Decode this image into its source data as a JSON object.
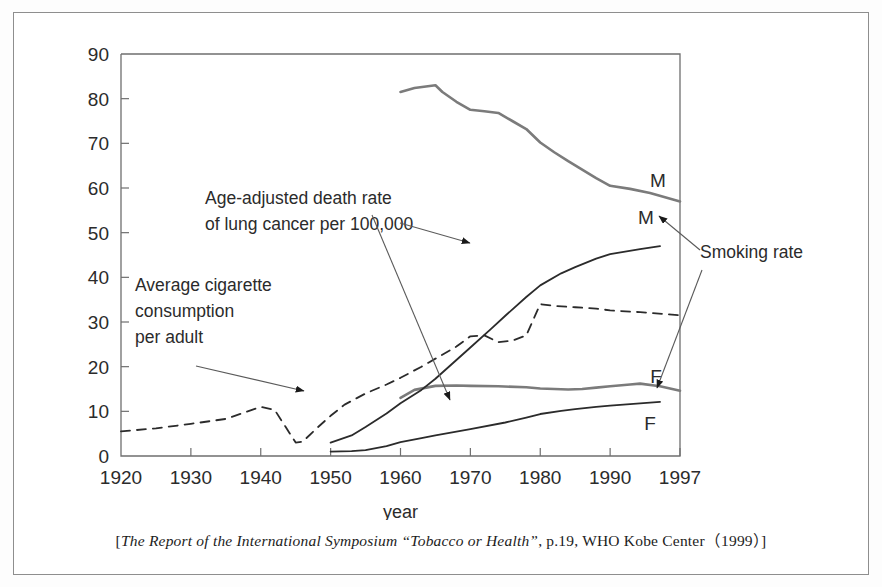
{
  "caption": {
    "open_bracket": "[",
    "italic_part": "The Report of the International Symposium “Tobacco or Health”",
    "rest": ", p.19, WHO Kobe Center（1999）",
    "close_bracket": "]"
  },
  "chart_data": {
    "type": "line",
    "title": "",
    "xlabel": "year",
    "ylabel": "",
    "xlim": [
      1920,
      1997
    ],
    "ylim": [
      0,
      90
    ],
    "grid": false,
    "legend": "inline-endpoint-labels",
    "xticks": [
      1920,
      1930,
      1940,
      1950,
      1960,
      1970,
      1980,
      1990,
      1997
    ],
    "xtick_labels": [
      "1920",
      "1930",
      "1940",
      "1950",
      "1960",
      "1970",
      "1980",
      "1990",
      "1997"
    ],
    "yticks": [
      0,
      10,
      20,
      30,
      40,
      50,
      60,
      70,
      80,
      90
    ],
    "ytick_labels": [
      "0",
      "10",
      "20",
      "30",
      "40",
      "50",
      "60",
      "70",
      "80",
      "90"
    ],
    "series": [
      {
        "name": "Smoking rate M",
        "style": "solid-gray",
        "color": "#7b7b7b",
        "width": 2.6,
        "endpoint_label": "M",
        "x": [
          1960,
          1962,
          1965,
          1966,
          1968,
          1970,
          1972,
          1974,
          1976,
          1978,
          1980,
          1982,
          1984,
          1986,
          1988,
          1990,
          1992,
          1994,
          1997
        ],
        "values": [
          81.5,
          82.4,
          83.0,
          81.5,
          79.3,
          77.5,
          77.2,
          76.8,
          75.0,
          73.2,
          70.2,
          68.0,
          66.0,
          64.1,
          62.2,
          60.5,
          59.8,
          58.9,
          57.0
        ]
      },
      {
        "name": "Smoking rate F",
        "style": "solid-gray",
        "color": "#7b7b7b",
        "width": 2.6,
        "endpoint_label": "F",
        "x": [
          1960,
          1962,
          1965,
          1968,
          1970,
          1974,
          1978,
          1980,
          1984,
          1986,
          1988,
          1990,
          1992,
          1993,
          1995,
          1997
        ],
        "values": [
          13.0,
          14.8,
          15.7,
          15.8,
          15.7,
          15.6,
          15.4,
          15.1,
          14.9,
          15.0,
          15.3,
          15.6,
          16.0,
          16.2,
          15.6,
          14.6
        ]
      },
      {
        "name": "Age-adjusted death rate of lung cancer M",
        "style": "solid-black",
        "color": "#2b2b2b",
        "width": 1.8,
        "endpoint_label": "M",
        "x": [
          1950,
          1953,
          1955,
          1958,
          1960,
          1963,
          1965,
          1968,
          1970,
          1973,
          1975,
          1978,
          1980,
          1983,
          1985,
          1988,
          1990,
          1993,
          1995
        ],
        "values": [
          3.0,
          4.6,
          6.5,
          9.5,
          11.8,
          14.8,
          17.3,
          21.5,
          24.3,
          28.5,
          31.4,
          35.6,
          38.2,
          40.9,
          42.3,
          44.2,
          45.2,
          46.3,
          47.0
        ]
      },
      {
        "name": "Age-adjusted death rate of lung cancer F",
        "style": "solid-black",
        "color": "#2b2b2b",
        "width": 1.8,
        "endpoint_label": "F",
        "x": [
          1950,
          1953,
          1955,
          1958,
          1960,
          1963,
          1965,
          1970,
          1975,
          1978,
          1980,
          1983,
          1985,
          1988,
          1990,
          1993,
          1995
        ],
        "values": [
          1.0,
          1.1,
          1.3,
          2.2,
          3.1,
          4.0,
          4.6,
          6.0,
          7.5,
          8.6,
          9.4,
          10.1,
          10.5,
          11.0,
          11.3,
          11.8,
          12.1
        ]
      },
      {
        "name": "Average cigarette consumption per adult",
        "style": "dashed",
        "color": "#2b2b2b",
        "width": 1.8,
        "endpoint_label": "",
        "x": [
          1920,
          1925,
          1930,
          1935,
          1940,
          1942,
          1945,
          1946,
          1948,
          1950,
          1952,
          1955,
          1958,
          1960,
          1963,
          1965,
          1968,
          1970,
          1972,
          1974,
          1976,
          1978,
          1980,
          1982,
          1985,
          1988,
          1990,
          1993,
          1997
        ],
        "values": [
          5.5,
          6.2,
          7.2,
          8.3,
          11.0,
          10.3,
          3.0,
          3.2,
          6.2,
          9.0,
          11.5,
          14.0,
          16.0,
          17.5,
          20.0,
          21.8,
          24.5,
          26.8,
          27.0,
          25.5,
          25.8,
          27.0,
          34.0,
          33.6,
          33.3,
          33.0,
          32.6,
          32.2,
          31.5
        ]
      }
    ],
    "annotations": [
      {
        "id": "lung-cancer-note",
        "lines": [
          "Age-adjusted death rate",
          "of lung cancer per 100,000"
        ],
        "arrows": [
          "to male lung cancer curve near 1985",
          "to female lung cancer curve near 1980"
        ]
      },
      {
        "id": "cigarette-note",
        "lines": [
          "Average cigarette",
          "consumption",
          "per adult"
        ],
        "arrows": [
          "to dashed cigarette consumption curve near 1950"
        ]
      },
      {
        "id": "smoking-rate-note",
        "lines": [
          "Smoking rate"
        ],
        "arrows": [
          "to male smoking rate curve near 1997",
          "to female smoking rate curve near 1997"
        ]
      }
    ]
  }
}
